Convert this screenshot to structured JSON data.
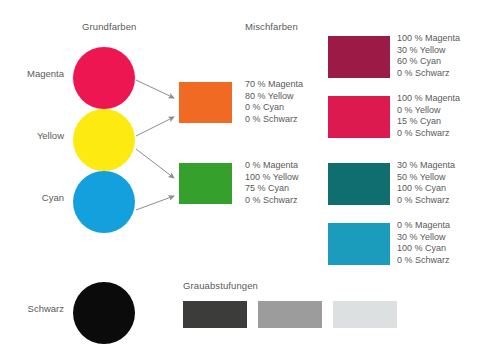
{
  "headings": {
    "primary": "Grundfarben",
    "mixed": "Mischfarben",
    "grayscale": "Grauabstufungen"
  },
  "primary_colors": [
    {
      "name": "magenta",
      "label": "Magenta",
      "hex": "#ED1651"
    },
    {
      "name": "yellow",
      "label": "Yellow",
      "hex": "#FCEA10"
    },
    {
      "name": "cyan",
      "label": "Cyan",
      "hex": "#14A0DC"
    },
    {
      "name": "schwarz",
      "label": "Schwarz",
      "hex": "#0B0B0B"
    }
  ],
  "mixed_colors": [
    {
      "name": "orange",
      "hex": "#F06A24",
      "spec": [
        "70 % Magenta",
        "80 % Yellow",
        "0 % Cyan",
        "0 % Schwarz"
      ]
    },
    {
      "name": "green",
      "hex": "#36A02C",
      "spec": [
        "0 % Magenta",
        "100 % Yellow",
        "75 % Cyan",
        "0 % Schwarz"
      ]
    }
  ],
  "extended_colors": [
    {
      "name": "burgundy",
      "hex": "#9B1A46",
      "spec": [
        "100 % Magenta",
        "30 % Yellow",
        "60 % Cyan",
        "0 % Schwarz"
      ]
    },
    {
      "name": "crimson",
      "hex": "#DC1A50",
      "spec": [
        "100 % Magenta",
        "0 % Yellow",
        "15 % Cyan",
        "0 % Schwarz"
      ]
    },
    {
      "name": "dark-teal",
      "hex": "#116E6E",
      "spec": [
        "30 % Magenta",
        "50 % Yellow",
        "100 % Cyan",
        "0 % Schwarz"
      ]
    },
    {
      "name": "light-teal",
      "hex": "#1C9CBC",
      "spec": [
        "0 % Magenta",
        "30 % Yellow",
        "100 % Cyan",
        "0 % Schwarz"
      ]
    }
  ],
  "grayscale": [
    {
      "name": "dark-gray",
      "hex": "#3C3C3B"
    },
    {
      "name": "medium-gray",
      "hex": "#9C9C9C"
    },
    {
      "name": "light-gray",
      "hex": "#DCE0E0"
    }
  ],
  "arrow_color": "#8C8C8C"
}
